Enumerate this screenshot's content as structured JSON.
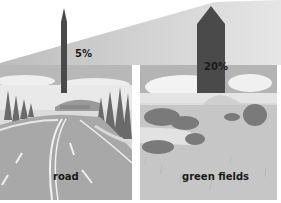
{
  "figure": {
    "colors": {
      "wedge": "#c8c8c8",
      "arrow": "#4a4a4a",
      "sky": "#b5b5b5",
      "cloud": "#f2f2f2",
      "road_surface": "#a9a9a9",
      "grass": "#c4c4c4",
      "trees": "#6e6e6e",
      "label_text": "#1a1a1a"
    },
    "items": [
      {
        "label": "road",
        "percent_label": "5%",
        "value": 5
      },
      {
        "label": "green fields",
        "percent_label": "20%",
        "value": 20
      }
    ]
  }
}
